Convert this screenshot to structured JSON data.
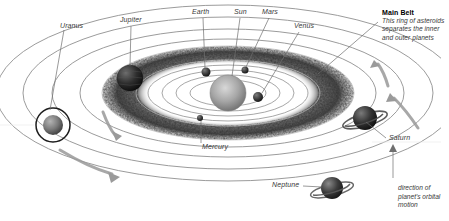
{
  "diagram": {
    "background_color": "#ffffff",
    "line_color": "#8d8d8d",
    "text_color": "#3a3a3a"
  },
  "labels": {
    "uranus": "Uranus",
    "jupiter": "Jupiter",
    "earth": "Earth",
    "sun": "Sun",
    "mars": "Mars",
    "venus": "Venus",
    "mercury": "Mercury",
    "saturn": "Saturn",
    "neptune": "Neptune"
  },
  "callout": {
    "title": "Main Belt",
    "line1": "This ring of asteroids",
    "line2": "separates the inner",
    "line3": "and outer planets"
  },
  "motion_note": {
    "line1": "direction of",
    "line2": "planet's orbital",
    "line3": "motion"
  },
  "bodies": [
    {
      "name": "sun",
      "label": "Sun",
      "cx": 228,
      "cy": 93,
      "r": 18,
      "type": "star",
      "color": "#9a9a9a"
    },
    {
      "name": "mercury",
      "label": "Mercury",
      "cx": 200,
      "cy": 118,
      "r": 3,
      "type": "planet",
      "color": "#2b2b2b"
    },
    {
      "name": "venus",
      "label": "Venus",
      "cx": 258,
      "cy": 97,
      "r": 5,
      "type": "planet",
      "color": "#3c3c3c"
    },
    {
      "name": "earth",
      "label": "Earth",
      "cx": 206,
      "cy": 72,
      "r": 4.5,
      "type": "planet",
      "color": "#4a4a4a"
    },
    {
      "name": "mars",
      "label": "Mars",
      "cx": 245,
      "cy": 70,
      "r": 3.5,
      "type": "planet",
      "color": "#3a3a3a"
    },
    {
      "name": "jupiter",
      "label": "Jupiter",
      "cx": 130,
      "cy": 78,
      "r": 13,
      "type": "planet",
      "color": "#242424"
    },
    {
      "name": "saturn",
      "label": "Saturn",
      "cx": 365,
      "cy": 118,
      "r": 12,
      "type": "ringed",
      "color": "#2a2a2a"
    },
    {
      "name": "uranus",
      "label": "Uranus",
      "cx": 53,
      "cy": 125,
      "r": 10,
      "type": "vertical-ringed",
      "color": "#5a5a5a"
    },
    {
      "name": "neptune",
      "label": "Neptune",
      "cx": 332,
      "cy": 188,
      "r": 11,
      "type": "ringed",
      "color": "#3b3b3b"
    }
  ],
  "orbits": [
    {
      "name": "mercury-orbit",
      "rx": 38,
      "ry": 13
    },
    {
      "name": "venus-orbit",
      "rx": 52,
      "ry": 18
    },
    {
      "name": "earth-orbit",
      "rx": 66,
      "ry": 23
    },
    {
      "name": "mars-orbit",
      "rx": 80,
      "ry": 28
    },
    {
      "name": "belt-inner",
      "rx": 96,
      "ry": 34
    },
    {
      "name": "belt-outer",
      "rx": 125,
      "ry": 46
    },
    {
      "name": "jupiter-orbit",
      "rx": 148,
      "ry": 54
    },
    {
      "name": "saturn-orbit",
      "rx": 176,
      "ry": 64
    },
    {
      "name": "uranus-orbit",
      "rx": 205,
      "ry": 76
    },
    {
      "name": "neptune-orbit",
      "rx": 232,
      "ry": 88
    }
  ],
  "label_positions": {
    "uranus": {
      "x": 60,
      "y": 22
    },
    "jupiter": {
      "x": 120,
      "y": 16
    },
    "earth": {
      "x": 192,
      "y": 8
    },
    "sun": {
      "x": 233,
      "y": 8
    },
    "mars": {
      "x": 261,
      "y": 8
    },
    "venus": {
      "x": 297,
      "y": 22
    },
    "mercury": {
      "x": 200,
      "y": 146
    },
    "saturn": {
      "x": 388,
      "y": 138
    },
    "neptune": {
      "x": 272,
      "y": 182
    }
  }
}
